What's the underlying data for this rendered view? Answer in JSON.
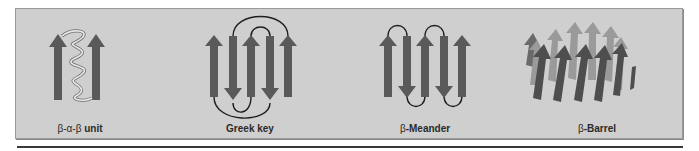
{
  "figure": {
    "panels": [
      {
        "id": "bab",
        "label_greek_prefix": "β-α-β",
        "label_text": " unit",
        "center_x": 80
      },
      {
        "id": "greek-key",
        "label_greek_prefix": "",
        "label_text": "Greek key",
        "center_x": 250
      },
      {
        "id": "meander",
        "label_greek_prefix": "β",
        "label_text": "-Meander",
        "center_x": 425
      },
      {
        "id": "barrel",
        "label_greek_prefix": "β",
        "label_text": "-Barrel",
        "center_x": 597
      }
    ],
    "colors": {
      "panel_bg": "#cfcfcf",
      "strand": "#5a5a5a",
      "strand_back": "#9a9a9a",
      "loop": "#1e1e1e",
      "helix": "#e8e8e8",
      "helix_outline": "#707070"
    }
  }
}
